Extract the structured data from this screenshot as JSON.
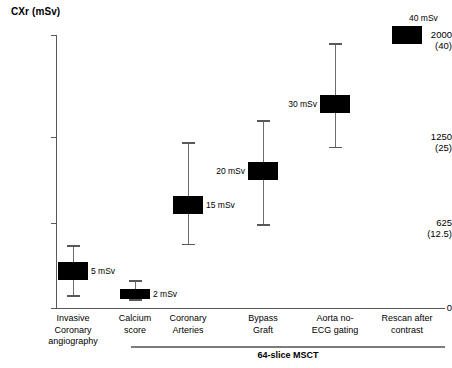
{
  "chart_data": {
    "type": "scatter",
    "title": "CXr (mSv)",
    "ylabel": "CXr (mSv)",
    "xlabel": "",
    "ylim": [
      0,
      2000
    ],
    "grid": false,
    "legend": "none",
    "y_ticks": [
      {
        "primary": "2000",
        "secondary": "(40)",
        "value": 2000
      },
      {
        "primary": "1250",
        "secondary": "(25)",
        "value": 1250
      },
      {
        "primary": "625",
        "secondary": "(12.5)",
        "value": 625
      },
      {
        "primary": "0",
        "secondary": "",
        "value": 0
      }
    ],
    "y_axis_note": "Primary axis in chest X-ray equivalents (CXr); value in parentheses is the effective dose in mSv",
    "categories": [
      "Invasive Coronary angiography",
      "Calcium score",
      "Coronary Arteries",
      "Bypass Graft",
      "Aorta no-ECG gating",
      "Rescan after contrast"
    ],
    "series": [
      {
        "name": "Effective radiation dose",
        "points": [
          {
            "category": "Invasive Coronary angiography",
            "label": "5 mSv",
            "value": 250,
            "box_low": 205,
            "box_high": 335,
            "whisker_low": 95,
            "whisker_high": 460
          },
          {
            "category": "Calcium score",
            "label": "2 mSv",
            "value": 100,
            "box_low": 65,
            "box_high": 140,
            "whisker_low": 65,
            "whisker_high": 205
          },
          {
            "category": "Coronary Arteries",
            "label": "15 mSv",
            "value": 750,
            "box_low": 690,
            "box_high": 820,
            "whisker_low": 470,
            "whisker_high": 1215
          },
          {
            "category": "Bypass Graft",
            "label": "20 mSv",
            "value": 1000,
            "box_low": 940,
            "box_high": 1070,
            "whisker_low": 615,
            "whisker_high": 1375
          },
          {
            "category": "Aorta no-ECG gating",
            "label": "30 mSv",
            "value": 1500,
            "box_low": 1430,
            "box_high": 1560,
            "whisker_low": 1180,
            "whisker_high": 1940
          },
          {
            "category": "Rescan after contrast",
            "label": "40 mSv",
            "value": 2000,
            "box_low": 1935,
            "box_high": 2065,
            "whisker_low": null,
            "whisker_high": null
          }
        ]
      }
    ],
    "group_bracket": {
      "label": "64-slice MSCT",
      "covers": [
        "Calcium score",
        "Coronary Arteries",
        "Bypass Graft",
        "Aorta no-ECG gating",
        "Rescan after contrast"
      ]
    }
  },
  "axis": {
    "ticks": [
      {
        "primary": "2000",
        "secondary": "(40)"
      },
      {
        "primary": "1250",
        "secondary": "(25)"
      },
      {
        "primary": "625",
        "secondary": "(12.5)"
      },
      {
        "primary": "0",
        "secondary": ""
      }
    ]
  },
  "labels": {
    "title": "CXr (mSv)",
    "group": "64-slice MSCT",
    "categories": [
      {
        "line1": "Invasive",
        "line2": "Coronary",
        "line3": "angiography"
      },
      {
        "line1": "Calcium",
        "line2": "score",
        "line3": ""
      },
      {
        "line1": "Coronary",
        "line2": "Arteries",
        "line3": ""
      },
      {
        "line1": "Bypass",
        "line2": "Graft",
        "line3": ""
      },
      {
        "line1": "Aorta no-",
        "line2": "ECG gating",
        "line3": ""
      },
      {
        "line1": "Rescan after",
        "line2": "contrast",
        "line3": ""
      }
    ],
    "points": [
      "5 mSv",
      "2 mSv",
      "15 mSv",
      "20 mSv",
      "30 mSv",
      "40 mSv"
    ]
  },
  "colors": {
    "marker": "#000000",
    "axis": "#58585a",
    "whisker": "#6c6c6e",
    "background": "#ffffff"
  }
}
